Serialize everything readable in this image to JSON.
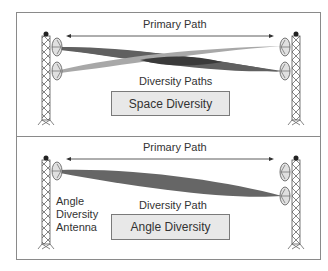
{
  "top_panel": {
    "primary_path_label": "Primary Path",
    "diversity_paths_label": "Diversity Paths",
    "method_label": "Space Diversity"
  },
  "bottom_panel": {
    "primary_path_label": "Primary Path",
    "diversity_path_label": "Diversity Path",
    "antenna_label_line1": "Angle",
    "antenna_label_line2": "Diversity",
    "antenna_label_line3": "Antenna",
    "method_label": "Angle Diversity"
  },
  "colors": {
    "beam_dark": "#555555",
    "beam_mid": "#707070",
    "beam_light": "#a8a8a8",
    "beam_overlap": "#3a3a3a",
    "box_fill": "#e8e8e8",
    "frame": "#8a8a8a"
  }
}
